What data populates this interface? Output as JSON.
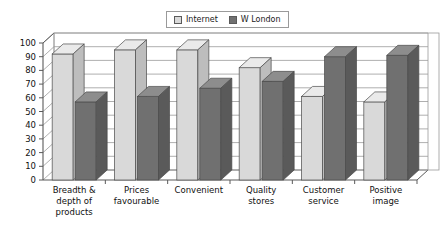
{
  "legend": {
    "position": "top-center",
    "entries": [
      {
        "label": "Internet",
        "color": "#d9d9d9",
        "swatch_name": "legend-swatch-internet"
      },
      {
        "label": "W London",
        "color": "#707070",
        "swatch_name": "legend-swatch-w-london"
      }
    ]
  },
  "colors": {
    "internet_front": "#d9d9d9",
    "internet_top": "#eaeaea",
    "internet_side": "#bdbdbd",
    "w_london_front": "#707070",
    "w_london_top": "#8d8d8d",
    "w_london_side": "#5a5a5a",
    "axis": "#5a5a5a",
    "gridline": "#9a9a9a",
    "background": "#ffffff"
  },
  "chart_data": {
    "type": "bar",
    "title": "",
    "subtitle": "",
    "xlabel": "",
    "ylabel": "",
    "ylim": [
      0,
      100
    ],
    "ytick_step": 10,
    "yticks": [
      0,
      10,
      20,
      30,
      40,
      50,
      60,
      70,
      80,
      90,
      100
    ],
    "grid": true,
    "three_d": true,
    "legend_position": "top-center",
    "categories": [
      "Breadth & depth of products",
      "Prices favourable",
      "Convenient",
      "Quality stores",
      "Customer service",
      "Positive image"
    ],
    "category_lines": [
      [
        "Breadth &",
        "depth of",
        "products"
      ],
      [
        "Prices",
        "favourable"
      ],
      [
        "Convenient"
      ],
      [
        "Quality",
        "stores"
      ],
      [
        "Customer",
        "service"
      ],
      [
        "Positive",
        "image"
      ]
    ],
    "series": [
      {
        "name": "Internet",
        "values": [
          92,
          95,
          95,
          82,
          61,
          57
        ]
      },
      {
        "name": "W London",
        "values": [
          57,
          61,
          67,
          72,
          90,
          91
        ]
      }
    ]
  }
}
